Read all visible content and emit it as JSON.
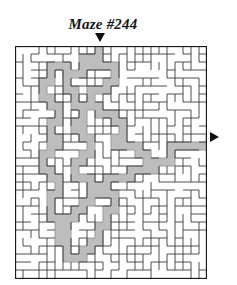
{
  "title": "Maze #244",
  "entry_arrow": {
    "icon": "triangle-down-icon",
    "direction": "down"
  },
  "exit_arrow": {
    "icon": "triangle-right-icon",
    "direction": "right"
  },
  "colors": {
    "wall": "#3a3a3a",
    "border": "#1a1a1a",
    "path_fill": "#bdbdbd",
    "path_edge": "#9a9a9a",
    "background": "#ffffff",
    "text": "#141414"
  },
  "maze": {
    "cols": 24,
    "rows": 29,
    "cell": 8,
    "origin_x": 15,
    "origin_y": 46,
    "entrance": {
      "col": 10,
      "side": "top"
    },
    "exit": {
      "row": 11,
      "side": "right"
    },
    "solution_cells": [
      [
        10,
        0
      ],
      [
        10,
        1
      ],
      [
        9,
        1
      ],
      [
        8,
        1
      ],
      [
        8,
        2
      ],
      [
        8,
        3
      ],
      [
        7,
        3
      ],
      [
        6,
        3
      ],
      [
        6,
        2
      ],
      [
        5,
        2
      ],
      [
        4,
        2
      ],
      [
        4,
        3
      ],
      [
        4,
        4
      ],
      [
        3,
        4
      ],
      [
        3,
        5
      ],
      [
        3,
        6
      ],
      [
        4,
        6
      ],
      [
        4,
        7
      ],
      [
        5,
        7
      ],
      [
        5,
        8
      ],
      [
        5,
        9
      ],
      [
        4,
        9
      ],
      [
        4,
        10
      ],
      [
        4,
        11
      ],
      [
        5,
        11
      ],
      [
        5,
        12
      ],
      [
        4,
        12
      ],
      [
        4,
        13
      ],
      [
        3,
        13
      ],
      [
        3,
        14
      ],
      [
        3,
        15
      ],
      [
        4,
        15
      ],
      [
        4,
        16
      ],
      [
        5,
        16
      ],
      [
        5,
        17
      ],
      [
        5,
        18
      ],
      [
        4,
        18
      ],
      [
        4,
        19
      ],
      [
        4,
        20
      ],
      [
        4,
        21
      ],
      [
        5,
        21
      ],
      [
        5,
        22
      ],
      [
        5,
        23
      ],
      [
        5,
        24
      ],
      [
        6,
        24
      ],
      [
        6,
        25
      ],
      [
        6,
        26
      ],
      [
        7,
        26
      ],
      [
        8,
        26
      ],
      [
        8,
        25
      ],
      [
        9,
        25
      ],
      [
        9,
        24
      ],
      [
        10,
        24
      ],
      [
        10,
        23
      ],
      [
        10,
        22
      ],
      [
        11,
        22
      ],
      [
        11,
        21
      ],
      [
        11,
        20
      ],
      [
        12,
        20
      ],
      [
        12,
        19
      ],
      [
        12,
        18
      ],
      [
        11,
        18
      ],
      [
        11,
        17
      ],
      [
        11,
        16
      ],
      [
        12,
        16
      ],
      [
        13,
        16
      ],
      [
        14,
        16
      ],
      [
        14,
        15
      ],
      [
        15,
        15
      ],
      [
        16,
        15
      ],
      [
        17,
        15
      ],
      [
        17,
        14
      ],
      [
        18,
        14
      ],
      [
        19,
        14
      ],
      [
        19,
        13
      ],
      [
        19,
        12
      ],
      [
        20,
        12
      ],
      [
        21,
        12
      ],
      [
        22,
        12
      ],
      [
        23,
        12
      ],
      [
        9,
        1
      ],
      [
        9,
        2
      ],
      [
        10,
        2
      ],
      [
        11,
        2
      ],
      [
        12,
        2
      ],
      [
        12,
        3
      ],
      [
        12,
        4
      ],
      [
        11,
        4
      ],
      [
        11,
        5
      ],
      [
        10,
        5
      ],
      [
        9,
        5
      ],
      [
        9,
        6
      ],
      [
        9,
        7
      ],
      [
        10,
        7
      ],
      [
        10,
        8
      ],
      [
        11,
        8
      ],
      [
        12,
        8
      ],
      [
        12,
        9
      ],
      [
        13,
        9
      ],
      [
        13,
        10
      ],
      [
        13,
        11
      ],
      [
        12,
        11
      ],
      [
        12,
        12
      ],
      [
        13,
        12
      ],
      [
        14,
        12
      ],
      [
        15,
        12
      ],
      [
        15,
        13
      ],
      [
        16,
        13
      ],
      [
        16,
        14
      ],
      [
        6,
        3
      ],
      [
        6,
        4
      ],
      [
        6,
        5
      ],
      [
        7,
        5
      ],
      [
        7,
        6
      ],
      [
        7,
        7
      ],
      [
        8,
        7
      ],
      [
        8,
        8
      ],
      [
        8,
        9
      ],
      [
        7,
        9
      ],
      [
        7,
        10
      ],
      [
        8,
        10
      ],
      [
        8,
        11
      ],
      [
        9,
        11
      ],
      [
        9,
        12
      ],
      [
        9,
        13
      ],
      [
        8,
        13
      ],
      [
        8,
        14
      ],
      [
        7,
        14
      ],
      [
        7,
        15
      ],
      [
        7,
        16
      ],
      [
        8,
        16
      ],
      [
        9,
        16
      ],
      [
        9,
        17
      ],
      [
        10,
        17
      ],
      [
        10,
        18
      ],
      [
        9,
        18
      ],
      [
        9,
        19
      ],
      [
        8,
        19
      ],
      [
        8,
        20
      ],
      [
        7,
        20
      ],
      [
        7,
        21
      ],
      [
        6,
        21
      ],
      [
        6,
        22
      ],
      [
        6,
        23
      ]
    ]
  }
}
